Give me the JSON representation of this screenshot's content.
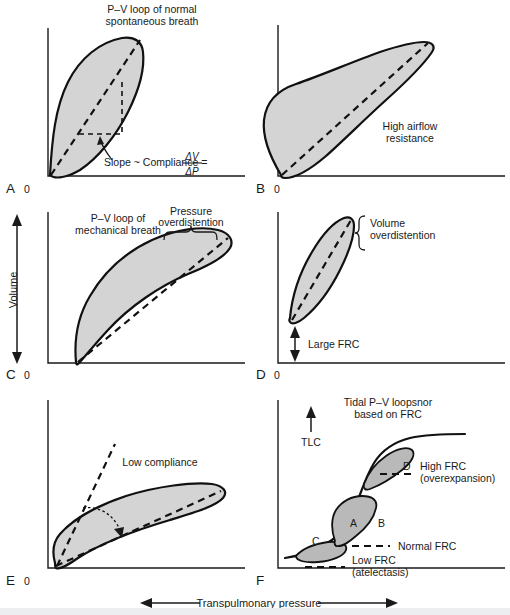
{
  "figure": {
    "axis_labels": {
      "y_axis": "Volume",
      "x_axis": "Transpulmonary pressure"
    },
    "origin_label": "0"
  },
  "panels": [
    {
      "letter": "A",
      "title_line1": "P–V loop of normal",
      "title_line2": "spontaneous breath",
      "annotation": "Slope ~ Compliance =",
      "fraction_numerator": "ΔV",
      "fraction_denominator": "ΔP",
      "origin": "0"
    },
    {
      "letter": "B",
      "title_line1": "High airflow",
      "title_line2": "resistance",
      "origin": "0"
    },
    {
      "letter": "C",
      "title_line1": "P–V loop of",
      "title_line2": "mechanical breath",
      "bracket_line1": "Pressure",
      "bracket_line2": "overdistention",
      "origin": "0"
    },
    {
      "letter": "D",
      "bracket_line1": "Volume",
      "bracket_line2": "overdistention",
      "arrow_label": "Large FRC",
      "origin": "0"
    },
    {
      "letter": "E",
      "annotation": "Low compliance",
      "origin": "0"
    },
    {
      "letter": "F",
      "title_line1": "Tidal P–V loopsnor",
      "title_line2": "based on FRC",
      "tlc_label": "TLC",
      "loop_labels": [
        "A",
        "B",
        "C",
        "D"
      ],
      "frc_high_line1": "High FRC",
      "frc_high_line2": "(overexpansion)",
      "frc_normal": "Normal FRC",
      "frc_low_line1": "Low FRC",
      "frc_low_line2": "(atelectasis)",
      "origin": "0"
    }
  ],
  "colors": {
    "loop_fill": "#d4d4d4",
    "loop_fill_dark": "#b9b9b9",
    "loop_fill_light": "#dedede",
    "stroke": "#111111",
    "background": "#ffffff"
  }
}
